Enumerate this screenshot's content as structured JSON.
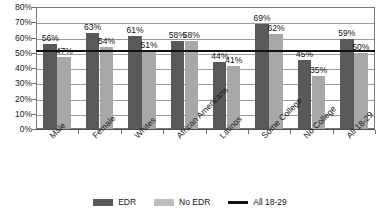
{
  "chart_data": {
    "type": "bar",
    "title": "",
    "subtitle": "",
    "xlabel": "",
    "ylabel": "",
    "ylim": [
      0,
      80
    ],
    "ytick_labels": [
      "80%",
      "70%",
      "60%",
      "50%",
      "40%",
      "30%",
      "20%",
      "10%",
      "0%"
    ],
    "ytick_values": [
      80,
      70,
      60,
      50,
      40,
      30,
      20,
      10,
      0
    ],
    "grid": true,
    "legend_position": "bottom",
    "categories": [
      "Male",
      "Female",
      "Whites",
      "African Americans",
      "Latinos",
      "Some College",
      "No College",
      "All 18-29"
    ],
    "series": [
      {
        "name": "EDR",
        "color": "#595959",
        "values": [
          56,
          63,
          61,
          58,
          44,
          69,
          45,
          59
        ],
        "labels": [
          "56%",
          "63%",
          "61%",
          "58%",
          "44%",
          "69%",
          "45%",
          "59%"
        ]
      },
      {
        "name": "No EDR",
        "color": "#a8a8a8",
        "values": [
          47,
          54,
          51,
          58,
          41,
          62,
          35,
          50
        ],
        "labels": [
          "47%",
          "54%",
          "51%",
          "58%",
          "41%",
          "62%",
          "35%",
          "50%"
        ]
      }
    ],
    "reference_line": {
      "name": "All 18-29",
      "color": "#111111",
      "value": 52
    }
  },
  "legend": {
    "items": [
      {
        "label": "EDR",
        "marker": "bar-dark"
      },
      {
        "label": "No EDR",
        "marker": "bar-light"
      },
      {
        "label": "All 18-29",
        "marker": "line-black"
      }
    ]
  }
}
